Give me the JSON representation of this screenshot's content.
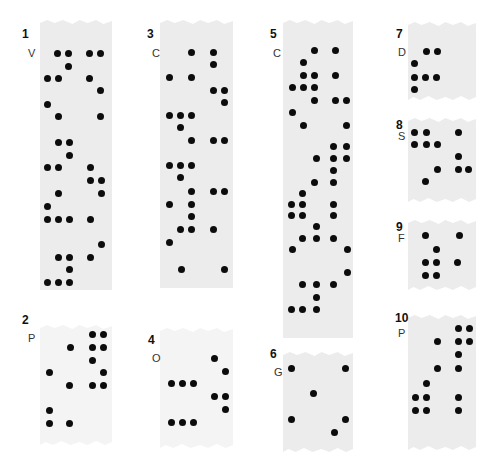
{
  "figure": {
    "panels": [
      {
        "id": "1",
        "letter": "V",
        "strip": {
          "x": 40,
          "y": 20,
          "w": 72,
          "h": 270,
          "style": "torn-top"
        },
        "num_pos": {
          "x": 22,
          "y": 27
        },
        "letter_pos": {
          "x": 28,
          "y": 47
        },
        "dots": [
          [
            57,
            53
          ],
          [
            68,
            53
          ],
          [
            89,
            53
          ],
          [
            100,
            53
          ],
          [
            68,
            66
          ],
          [
            47,
            78
          ],
          [
            58,
            78
          ],
          [
            89,
            78
          ],
          [
            100,
            90
          ],
          [
            47,
            104
          ],
          [
            58,
            116
          ],
          [
            100,
            116
          ],
          [
            58,
            142
          ],
          [
            69,
            142
          ],
          [
            69,
            155
          ],
          [
            47,
            167
          ],
          [
            58,
            167
          ],
          [
            90,
            167
          ],
          [
            90,
            180
          ],
          [
            101,
            180
          ],
          [
            58,
            193
          ],
          [
            101,
            193
          ],
          [
            47,
            206
          ],
          [
            47,
            219
          ],
          [
            58,
            219
          ],
          [
            69,
            219
          ],
          [
            90,
            219
          ],
          [
            101,
            244
          ],
          [
            58,
            257
          ],
          [
            69,
            257
          ],
          [
            90,
            257
          ],
          [
            69,
            269
          ],
          [
            47,
            282
          ],
          [
            58,
            282
          ],
          [
            69,
            282
          ]
        ]
      },
      {
        "id": "2",
        "letter": "P",
        "strip": {
          "x": 40,
          "y": 325,
          "w": 72,
          "h": 120,
          "style": "faint"
        },
        "num_pos": {
          "x": 22,
          "y": 313
        },
        "letter_pos": {
          "x": 28,
          "y": 332
        },
        "dots": [
          [
            92,
            334
          ],
          [
            103,
            334
          ],
          [
            70,
            347
          ],
          [
            92,
            347
          ],
          [
            103,
            347
          ],
          [
            92,
            360
          ],
          [
            49,
            372
          ],
          [
            103,
            372
          ],
          [
            69,
            385
          ],
          [
            92,
            385
          ],
          [
            103,
            385
          ],
          [
            49,
            410
          ],
          [
            49,
            423
          ],
          [
            69,
            423
          ]
        ]
      },
      {
        "id": "3",
        "letter": "C",
        "strip": {
          "x": 160,
          "y": 20,
          "w": 73,
          "h": 268,
          "style": "torn-top"
        },
        "num_pos": {
          "x": 147,
          "y": 27
        },
        "letter_pos": {
          "x": 152,
          "y": 47
        },
        "dots": [
          [
            191,
            52
          ],
          [
            213,
            52
          ],
          [
            213,
            64
          ],
          [
            169,
            77
          ],
          [
            191,
            77
          ],
          [
            213,
            90
          ],
          [
            224,
            90
          ],
          [
            224,
            102
          ],
          [
            169,
            115
          ],
          [
            180,
            115
          ],
          [
            191,
            115
          ],
          [
            180,
            127
          ],
          [
            191,
            140
          ],
          [
            213,
            140
          ],
          [
            224,
            140
          ],
          [
            169,
            165
          ],
          [
            180,
            165
          ],
          [
            191,
            165
          ],
          [
            180,
            177
          ],
          [
            191,
            191
          ],
          [
            213,
            191
          ],
          [
            224,
            191
          ],
          [
            169,
            204
          ],
          [
            191,
            204
          ],
          [
            191,
            216
          ],
          [
            180,
            229
          ],
          [
            191,
            229
          ],
          [
            213,
            229
          ],
          [
            169,
            242
          ],
          [
            181,
            269
          ],
          [
            224,
            269
          ]
        ]
      },
      {
        "id": "4",
        "letter": "O",
        "strip": {
          "x": 160,
          "y": 328,
          "w": 73,
          "h": 120,
          "style": "faint"
        },
        "num_pos": {
          "x": 148,
          "y": 333
        },
        "letter_pos": {
          "x": 152,
          "y": 352
        },
        "dots": [
          [
            214,
            358
          ],
          [
            225,
            371
          ],
          [
            171,
            383
          ],
          [
            182,
            383
          ],
          [
            193,
            383
          ],
          [
            214,
            396
          ],
          [
            225,
            396
          ],
          [
            225,
            409
          ],
          [
            171,
            422
          ],
          [
            182,
            422
          ],
          [
            193,
            422
          ]
        ]
      },
      {
        "id": "5",
        "letter": "C",
        "strip": {
          "x": 283,
          "y": 20,
          "w": 70,
          "h": 318,
          "style": "torn-top"
        },
        "num_pos": {
          "x": 270,
          "y": 27
        },
        "letter_pos": {
          "x": 273,
          "y": 47
        },
        "dots": [
          [
            314,
            50
          ],
          [
            335,
            50
          ],
          [
            303,
            62
          ],
          [
            303,
            75
          ],
          [
            314,
            75
          ],
          [
            335,
            75
          ],
          [
            292,
            87
          ],
          [
            303,
            87
          ],
          [
            314,
            87
          ],
          [
            314,
            100
          ],
          [
            335,
            100
          ],
          [
            346,
            100
          ],
          [
            292,
            112
          ],
          [
            303,
            125
          ],
          [
            346,
            125
          ],
          [
            333,
            146
          ],
          [
            346,
            146
          ],
          [
            316,
            158
          ],
          [
            333,
            158
          ],
          [
            346,
            158
          ],
          [
            333,
            170
          ],
          [
            314,
            182
          ],
          [
            333,
            182
          ],
          [
            302,
            193
          ],
          [
            291,
            204
          ],
          [
            302,
            204
          ],
          [
            333,
            204
          ],
          [
            291,
            215
          ],
          [
            302,
            215
          ],
          [
            333,
            215
          ],
          [
            316,
            226
          ],
          [
            302,
            238
          ],
          [
            316,
            238
          ],
          [
            333,
            238
          ],
          [
            292,
            249
          ],
          [
            347,
            249
          ],
          [
            347,
            272
          ],
          [
            302,
            284
          ],
          [
            316,
            284
          ],
          [
            333,
            284
          ],
          [
            316,
            297
          ],
          [
            291,
            309
          ],
          [
            302,
            309
          ],
          [
            316,
            309
          ]
        ]
      },
      {
        "id": "6",
        "letter": "G",
        "strip": {
          "x": 283,
          "y": 352,
          "w": 70,
          "h": 100,
          "style": "torn-both"
        },
        "num_pos": {
          "x": 270,
          "y": 347
        },
        "letter_pos": {
          "x": 274,
          "y": 366
        },
        "dots": [
          [
            291,
            368
          ],
          [
            345,
            368
          ],
          [
            313,
            393
          ],
          [
            291,
            419
          ],
          [
            345,
            419
          ],
          [
            334,
            432
          ]
        ]
      },
      {
        "id": "7",
        "letter": "D",
        "strip": {
          "x": 408,
          "y": 22,
          "w": 68,
          "h": 78,
          "style": "torn-both"
        },
        "num_pos": {
          "x": 396,
          "y": 27
        },
        "letter_pos": {
          "x": 398,
          "y": 46
        },
        "dots": [
          [
            426,
            51
          ],
          [
            437,
            51
          ],
          [
            414,
            63
          ],
          [
            414,
            77
          ],
          [
            425,
            77
          ],
          [
            436,
            77
          ],
          [
            414,
            89
          ]
        ]
      },
      {
        "id": "8",
        "letter": "S",
        "strip": {
          "x": 408,
          "y": 118,
          "w": 68,
          "h": 84,
          "style": "torn-both"
        },
        "num_pos": {
          "x": 396,
          "y": 118
        },
        "letter_pos": {
          "x": 398,
          "y": 130
        },
        "dots": [
          [
            414,
            132
          ],
          [
            426,
            132
          ],
          [
            458,
            132
          ],
          [
            414,
            144
          ],
          [
            426,
            144
          ],
          [
            437,
            144
          ],
          [
            458,
            156
          ],
          [
            437,
            169
          ],
          [
            458,
            169
          ],
          [
            468,
            169
          ],
          [
            425,
            181
          ]
        ]
      },
      {
        "id": "9",
        "letter": "F",
        "strip": {
          "x": 408,
          "y": 220,
          "w": 68,
          "h": 70,
          "style": "torn-both"
        },
        "num_pos": {
          "x": 396,
          "y": 220
        },
        "letter_pos": {
          "x": 398,
          "y": 232
        },
        "dots": [
          [
            425,
            235
          ],
          [
            459,
            235
          ],
          [
            436,
            249
          ],
          [
            425,
            262
          ],
          [
            436,
            262
          ],
          [
            457,
            262
          ],
          [
            425,
            275
          ],
          [
            436,
            275
          ]
        ]
      },
      {
        "id": "10",
        "letter": "P",
        "strip": {
          "x": 408,
          "y": 315,
          "w": 68,
          "h": 135,
          "style": "torn-both"
        },
        "num_pos": {
          "x": 395,
          "y": 311
        },
        "letter_pos": {
          "x": 398,
          "y": 327
        },
        "dots": [
          [
            458,
            328
          ],
          [
            469,
            328
          ],
          [
            437,
            341
          ],
          [
            458,
            341
          ],
          [
            469,
            341
          ],
          [
            458,
            354
          ],
          [
            437,
            368
          ],
          [
            458,
            368
          ],
          [
            426,
            383
          ],
          [
            415,
            397
          ],
          [
            426,
            397
          ],
          [
            458,
            397
          ],
          [
            415,
            410
          ],
          [
            426,
            410
          ],
          [
            458,
            410
          ]
        ]
      }
    ]
  }
}
